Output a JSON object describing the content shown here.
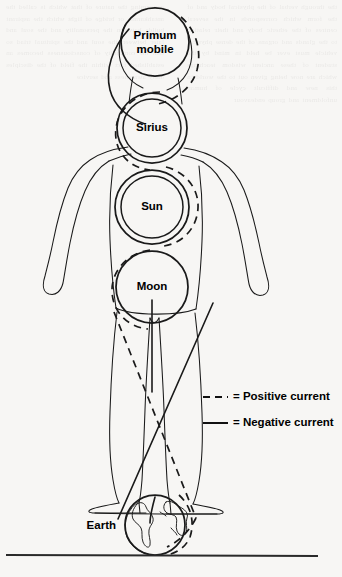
{
  "figure": {
    "name": "celestial-body-currents-diagram",
    "background_color": "#f7f6f4",
    "ink_color": "#1a1a1a"
  },
  "spheres": [
    {
      "id": "primum-mobile",
      "label_line1": "Primum",
      "label_line2": "mobile",
      "cx": 155,
      "cy": 42,
      "r": 34,
      "rings": 1,
      "label_position": "inside"
    },
    {
      "id": "sirius",
      "label_line1": "Sirius",
      "label_line2": "",
      "cx": 152,
      "cy": 128,
      "r": 35,
      "rings": 2,
      "label_position": "inside"
    },
    {
      "id": "sun",
      "label_line1": "Sun",
      "label_line2": "",
      "cx": 152,
      "cy": 207,
      "r": 37,
      "rings": 2,
      "label_position": "inside"
    },
    {
      "id": "moon",
      "label_line1": "Moon",
      "label_line2": "",
      "cx": 152,
      "cy": 287,
      "r": 36,
      "rings": 1,
      "label_position": "inside"
    },
    {
      "id": "earth",
      "label_line1": "Earth",
      "label_line2": "",
      "cx": 155,
      "cy": 525,
      "r": 30,
      "rings": 1,
      "label_position": "left"
    }
  ],
  "legend": {
    "title": "",
    "position": "right-middle",
    "items": [
      {
        "id": "positive-current",
        "style": "dashed",
        "label": "= Positive current",
        "color": "#111111"
      },
      {
        "id": "negative-current",
        "style": "solid",
        "label": "= Negative current",
        "color": "#111111"
      }
    ]
  },
  "bleed_text": {
    "left": "the through verbal of the physical body and of the form which corresponds in the several centres of the etheric body and their relation to the glands and organs of the dense physical vehicle must ever be held in mind by the student of these ancient wisdom teachings which are now being given out to the world in this new and difficult cycle of human unfoldment and group endeavour",
    "right": "concerning the nature of that which is called the antahkarana or bridge of light which the aspirant builds between the personality and the soul and later between the soul and the spiritual triad so that the continuity of consciousness becomes an established fact within the field of the disciples daily awareness and service"
  }
}
